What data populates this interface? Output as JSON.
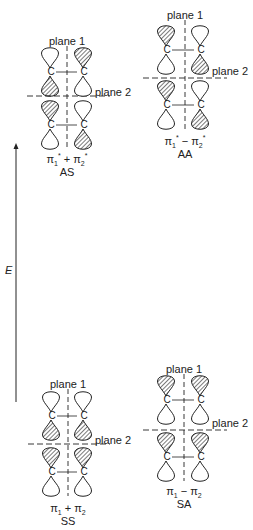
{
  "axis": {
    "label": "E",
    "arrow": {
      "x": 16,
      "y_top": 143,
      "y_bottom": 402
    }
  },
  "diagrams": [
    {
      "id": "AS",
      "symmetry_label": "AS",
      "combo": {
        "base": "π",
        "text_parts": [
          "π",
          "1",
          "*",
          " + ",
          "π",
          "2",
          "*"
        ],
        "display": "π1* + π2*"
      },
      "plane1_label": "plane 1",
      "plane2_label": "plane 2",
      "left_x": 50,
      "right_x": 83,
      "center_x": 67,
      "plane1_label_y": 35,
      "plane2_y": 96,
      "plane2_label_y": 86,
      "top_c_y": 72,
      "bottom_c_y": 125,
      "combo_y": 153,
      "sym_y": 166,
      "shading": {
        "left_upper_top": false,
        "left_upper_bottom": true,
        "right_upper_top": true,
        "right_upper_bottom": false,
        "left_lower_top": true,
        "left_lower_bottom": false,
        "right_lower_top": false,
        "right_lower_bottom": true
      }
    },
    {
      "id": "AA",
      "symmetry_label": "AA",
      "combo": {
        "display": "π1* − π2*"
      },
      "plane1_label": "plane 1",
      "plane2_label": "plane 2",
      "left_x": 166,
      "right_x": 200,
      "center_x": 185,
      "plane1_label_y": 9,
      "plane2_y": 78,
      "plane2_label_y": 65,
      "top_c_y": 50,
      "bottom_c_y": 105,
      "combo_y": 135,
      "sym_y": 148,
      "shading": {
        "left_upper_top": true,
        "left_upper_bottom": false,
        "right_upper_top": false,
        "right_upper_bottom": true,
        "left_lower_top": true,
        "left_lower_bottom": false,
        "right_lower_top": false,
        "right_lower_bottom": true
      }
    },
    {
      "id": "SS",
      "symmetry_label": "SS",
      "combo": {
        "display": "π1 + π2"
      },
      "plane1_label": "plane 1",
      "plane2_label": "plane 2",
      "left_x": 51,
      "right_x": 83,
      "center_x": 68,
      "plane1_label_y": 378,
      "plane2_y": 444,
      "plane2_label_y": 434,
      "top_c_y": 416,
      "bottom_c_y": 472,
      "combo_y": 502,
      "sym_y": 515,
      "shading": {
        "left_upper_top": false,
        "left_upper_bottom": true,
        "right_upper_top": false,
        "right_upper_bottom": true,
        "left_lower_top": true,
        "left_lower_bottom": false,
        "right_lower_top": true,
        "right_lower_bottom": false
      }
    },
    {
      "id": "SA",
      "symmetry_label": "SA",
      "combo": {
        "display": "π1 − π2"
      },
      "plane1_label": "plane 1",
      "plane2_label": "plane 2",
      "left_x": 166,
      "right_x": 200,
      "center_x": 184,
      "plane1_label_y": 363,
      "plane2_y": 430,
      "plane2_label_y": 417,
      "top_c_y": 400,
      "bottom_c_y": 457,
      "combo_y": 485,
      "sym_y": 498,
      "shading": {
        "left_upper_top": true,
        "left_upper_bottom": false,
        "right_upper_top": true,
        "right_upper_bottom": false,
        "left_lower_top": true,
        "left_lower_bottom": false,
        "right_lower_top": true,
        "right_lower_bottom": false
      }
    }
  ],
  "labels": {
    "AS": {
      "combo_html": "π<sub>1</sub><sup>*</sup> + π<sub>2</sub><sup>*</sup>",
      "sym": "AS"
    },
    "AA": {
      "combo_html": "π<sub>1</sub><sup>*</sup> − π<sub>2</sub><sup>*</sup>",
      "sym": "AA"
    },
    "SS": {
      "combo_html": "π<sub>1</sub> + π<sub>2</sub>",
      "sym": "SS"
    },
    "SA": {
      "combo_html": "π<sub>1</sub> − π<sub>2</sub>",
      "sym": "SA"
    }
  },
  "atom_label": "C",
  "colors": {
    "ink": "#222222",
    "background": "#ffffff"
  }
}
